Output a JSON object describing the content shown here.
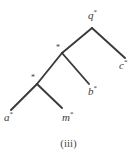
{
  "figure": {
    "caption": "(iii)",
    "type": "phylogenetic-tree",
    "stroke_color": "#3a3a3a",
    "background_color": "#ffffff",
    "text_color": "#3a3a3a"
  },
  "tree": {
    "nodes": [
      {
        "id": "root",
        "kind": "root",
        "x": 92,
        "y": 28,
        "marker": ""
      },
      {
        "id": "internal1",
        "kind": "internal",
        "x": 62,
        "y": 53,
        "marker": "*"
      },
      {
        "id": "internal2",
        "kind": "internal",
        "x": 37,
        "y": 84,
        "marker": "*"
      },
      {
        "id": "leaf_c",
        "kind": "leaf",
        "x": 125,
        "y": 58,
        "marker": ""
      },
      {
        "id": "leaf_b",
        "kind": "leaf",
        "x": 89,
        "y": 84,
        "marker": ""
      },
      {
        "id": "leaf_a",
        "kind": "leaf",
        "x": 11,
        "y": 110,
        "marker": ""
      },
      {
        "id": "leaf_m",
        "kind": "leaf",
        "x": 62,
        "y": 108,
        "marker": ""
      }
    ],
    "edges": [
      {
        "from": "root",
        "to": "internal1"
      },
      {
        "from": "root",
        "to": "leaf_c"
      },
      {
        "from": "internal1",
        "to": "internal2"
      },
      {
        "from": "internal1",
        "to": "leaf_b"
      },
      {
        "from": "internal2",
        "to": "leaf_a"
      },
      {
        "from": "internal2",
        "to": "leaf_m"
      }
    ],
    "labels": {
      "root": {
        "letter": "q",
        "star": "*",
        "x": 88,
        "y": 9,
        "node": "root"
      },
      "leaf_c": {
        "letter": "c",
        "star": "*",
        "x": 119,
        "y": 59,
        "node": "leaf_c"
      },
      "leaf_b": {
        "letter": "b",
        "star": "*",
        "x": 88,
        "y": 85,
        "node": "leaf_b"
      },
      "leaf_a": {
        "letter": "a",
        "star": "*",
        "x": 4,
        "y": 111,
        "node": "leaf_a"
      },
      "leaf_m": {
        "letter": "m",
        "star": "*",
        "x": 62,
        "y": 111,
        "node": "leaf_m"
      }
    },
    "node_markers": {
      "internal1": {
        "glyph": "*",
        "x": 56,
        "y": 44
      },
      "internal2": {
        "glyph": "*",
        "x": 31,
        "y": 74
      }
    }
  }
}
